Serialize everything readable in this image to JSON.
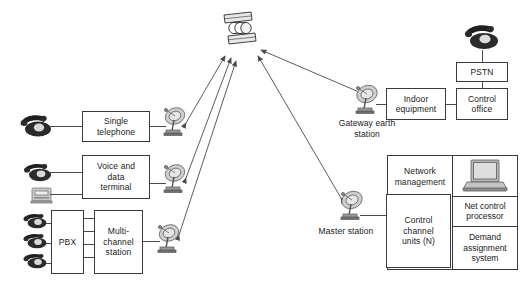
{
  "diagram": {
    "background": "#ffffff",
    "line_color": "#3a3a3a",
    "icons": {
      "satellite": "satellite-icon",
      "dish": "satellite-dish-icon",
      "telephone": "telephone-icon",
      "data_terminal": "data-terminal-icon",
      "laptop": "laptop-computer-icon"
    }
  },
  "space_segment": {
    "satellite_label": "satellite"
  },
  "left_segment": {
    "single_telephone": "Single\ntelephone",
    "single_telephone_line1": "Single",
    "single_telephone_line2": "telephone",
    "voice_data_line1": "Voice and",
    "voice_data_line2": "data",
    "voice_data_line3": "terminal",
    "pbx": "PBX",
    "multichannel_line1": "Multi-",
    "multichannel_line2": "channel",
    "multichannel_line3": "station",
    "phones": [
      "telephone-icon",
      "telephone-icon",
      "telephone-icon"
    ],
    "terminal_phone": "telephone-icon",
    "terminal_device": "data-terminal-icon"
  },
  "gateway_segment": {
    "station_label_line1": "Gateway earth",
    "station_label_line2": "station",
    "indoor_line1": "Indoor",
    "indoor_line2": "equipment",
    "pstn": "PSTN",
    "control_office_line1": "Control",
    "control_office_line2": "office",
    "pstn_phone": "telephone-icon"
  },
  "master_segment": {
    "station_label": "Master station",
    "network_management_line1": "Network",
    "network_management_line2": "management",
    "control_units_line1": "Control",
    "control_units_line2": "channel",
    "control_units_line3": "units (N)",
    "net_control_line1": "Net control",
    "net_control_line2": "processor",
    "demand_line1": "Demand",
    "demand_line2": "assignment",
    "demand_line3": "system"
  },
  "rf_links": [
    {
      "name": "link-satellite-single-telephone",
      "bidirectional": true
    },
    {
      "name": "link-satellite-voice-data-terminal",
      "bidirectional": true
    },
    {
      "name": "link-satellite-multichannel-station",
      "bidirectional": true
    },
    {
      "name": "link-satellite-gateway-earth-station",
      "bidirectional": true
    },
    {
      "name": "link-satellite-master-station",
      "bidirectional": true
    }
  ]
}
